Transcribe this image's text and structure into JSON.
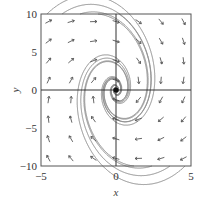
{
  "chart_data": {
    "type": "vector_field",
    "title": "",
    "xlabel": "x",
    "ylabel": "y",
    "xlim": [
      -5,
      5
    ],
    "ylim": [
      -10,
      10
    ],
    "x_ticks": [
      -5,
      0,
      5
    ],
    "y_ticks": [
      -10,
      -5,
      0,
      5,
      10
    ],
    "x_tick_labels": [
      "−5",
      "0",
      "5"
    ],
    "y_tick_labels": [
      "−10",
      "−5",
      "0",
      "5",
      "10"
    ],
    "grid": false,
    "axes_through_origin": true,
    "equilibrium": {
      "x": 0,
      "y": 0,
      "kind": "spiral sink"
    },
    "field_description": "Direction field with clockwise trajectories spiraling into the origin; arrows point up for x<0 and down for x>0",
    "field_model": {
      "dx": "y/2 - 0.3x",
      "dy": "-2x - 0.3y"
    },
    "arrow_grid": {
      "columns": 7,
      "rows": 8
    },
    "trajectory_count": 9,
    "colors": {
      "axes": "#333333",
      "arrows": "#555555",
      "trajectories": "#8a8a8a",
      "equilibrium": "#111111"
    }
  }
}
